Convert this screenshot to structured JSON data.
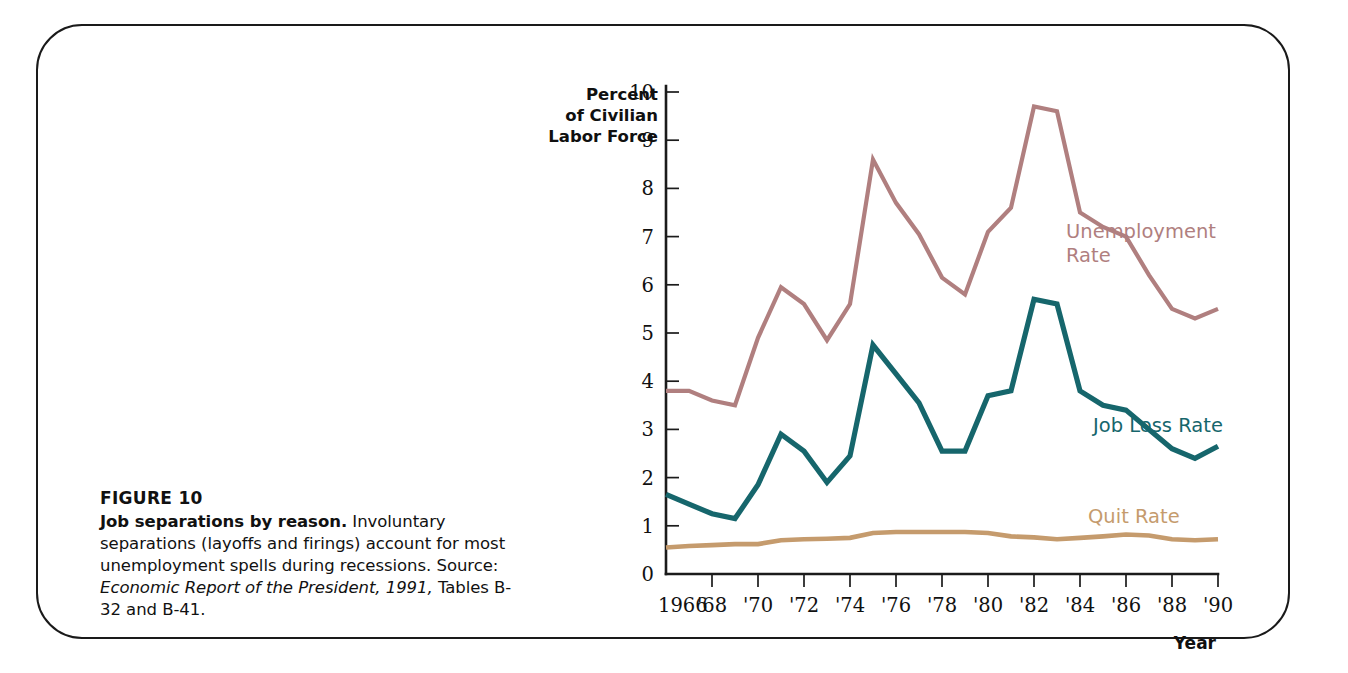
{
  "figure": {
    "head": "FIGURE 10",
    "lead": "Job separations by reason.",
    "body_1": "Involuntary",
    "body_2": "separations (layoffs and firings) account",
    "body_3": "for most unemployment spells during",
    "body_4": "recessions.",
    "source_label": "Source:",
    "source_italic_1": "Economic Report of the",
    "source_italic_2": "President, 1991,",
    "source_tail": "Tables B-32 and B-41."
  },
  "axes": {
    "y_label_line1": "Percent",
    "y_label_line2": "of Civilian",
    "y_label_line3": "Labor Force",
    "x_title": "Year",
    "y_ticks": [
      "10",
      "9",
      "8",
      "7",
      "6",
      "5",
      "4",
      "3",
      "2",
      "1",
      "0"
    ],
    "x_tick_labels": [
      "1966",
      "'68",
      "'70",
      "'72",
      "'74",
      "'76",
      "'78",
      "'80",
      "'82",
      "'84",
      "'86",
      "'88",
      "'90"
    ],
    "y_min": 0,
    "y_max": 10,
    "x_min": 1966,
    "x_max": 1990
  },
  "colors": {
    "unemployment": "#b07f7f",
    "job_loss": "#16666c",
    "quit": "#c59b6d",
    "axis": "#1b1b1b",
    "text": "#111111",
    "frame": "#1a1a1a"
  },
  "series_labels": {
    "unemployment_line1": "Unemployment",
    "unemployment_line2": "Rate",
    "job_loss": "Job Loss Rate",
    "quit": "Quit Rate"
  },
  "chart_data": {
    "type": "line",
    "title": "Job separations by reason",
    "xlabel": "Year",
    "ylabel": "Percent of Civilian Labor Force",
    "xlim": [
      1966,
      1990
    ],
    "ylim": [
      0,
      10
    ],
    "grid": false,
    "legend": "inline-right-labels",
    "x": [
      1966,
      1967,
      1968,
      1969,
      1970,
      1971,
      1972,
      1973,
      1974,
      1975,
      1976,
      1977,
      1978,
      1979,
      1980,
      1981,
      1982,
      1983,
      1984,
      1985,
      1986,
      1987,
      1988,
      1989,
      1990
    ],
    "series": [
      {
        "name": "Unemployment Rate",
        "color": "#b07f7f",
        "values": [
          3.8,
          3.8,
          3.6,
          3.5,
          4.9,
          5.95,
          5.6,
          4.85,
          5.6,
          8.6,
          7.7,
          7.05,
          6.15,
          5.8,
          7.1,
          7.6,
          9.7,
          9.6,
          7.5,
          7.2,
          7.0,
          6.2,
          5.5,
          5.3,
          5.5
        ]
      },
      {
        "name": "Job Loss Rate",
        "color": "#16666c",
        "values": [
          1.65,
          1.45,
          1.25,
          1.15,
          1.85,
          2.9,
          2.55,
          1.9,
          2.45,
          4.75,
          4.15,
          3.55,
          2.55,
          2.55,
          3.7,
          3.8,
          5.7,
          5.6,
          3.8,
          3.5,
          3.4,
          3.0,
          2.6,
          2.4,
          2.65
        ]
      },
      {
        "name": "Quit Rate",
        "color": "#c59b6d",
        "values": [
          0.55,
          0.58,
          0.6,
          0.62,
          0.62,
          0.7,
          0.72,
          0.73,
          0.75,
          0.85,
          0.87,
          0.87,
          0.87,
          0.87,
          0.85,
          0.78,
          0.76,
          0.72,
          0.75,
          0.78,
          0.82,
          0.8,
          0.72,
          0.7,
          0.72
        ]
      }
    ]
  }
}
